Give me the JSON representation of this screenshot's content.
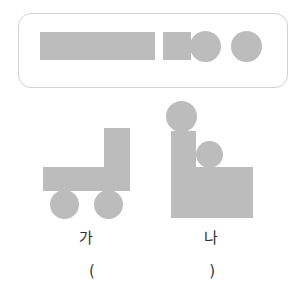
{
  "page": {
    "width": 304,
    "height": 298,
    "background_color": "#ffffff",
    "shape_fill_color": "#bcbcbc",
    "box_border_color": "#d2d2d2",
    "text_color": "#2f2f2f"
  },
  "parts_box": {
    "name": "parts-box",
    "x": 18,
    "y": 13,
    "width": 270,
    "height": 75,
    "corner_radius": 13,
    "shapes": [
      {
        "id": "long-rectangle",
        "type": "rectangle",
        "x": 40,
        "y": 32,
        "width": 115,
        "height": 28
      },
      {
        "id": "small-rectangle",
        "type": "rectangle",
        "x": 163,
        "y": 32,
        "width": 28,
        "height": 28
      },
      {
        "id": "circle-1",
        "type": "circle",
        "x": 190,
        "y": 31,
        "width": 31,
        "height": 31
      },
      {
        "id": "circle-2",
        "type": "circle",
        "x": 231,
        "y": 31,
        "width": 31,
        "height": 31
      }
    ]
  },
  "figures": [
    {
      "id": "figure-ga",
      "label": "가",
      "label_x": 86,
      "label_y": 231,
      "shapes": [
        {
          "id": "ga-vertical-rectangle",
          "type": "rectangle",
          "x": 104,
          "y": 128,
          "width": 26,
          "height": 40
        },
        {
          "id": "ga-horizontal-rectangle",
          "type": "rectangle",
          "x": 43,
          "y": 167,
          "width": 87,
          "height": 24
        },
        {
          "id": "ga-wheel-left",
          "type": "circle",
          "x": 50,
          "y": 190,
          "width": 29,
          "height": 29
        },
        {
          "id": "ga-wheel-right",
          "type": "circle",
          "x": 94,
          "y": 190,
          "width": 29,
          "height": 29
        }
      ]
    },
    {
      "id": "figure-na",
      "label": "나",
      "label_x": 211,
      "label_y": 231,
      "shapes": [
        {
          "id": "na-top-circle",
          "type": "circle",
          "x": 166,
          "y": 101,
          "width": 31,
          "height": 31
        },
        {
          "id": "na-tall-rectangle",
          "type": "rectangle",
          "x": 171,
          "y": 131,
          "width": 25,
          "height": 87
        },
        {
          "id": "na-middle-circle",
          "type": "circle",
          "x": 196,
          "y": 141,
          "width": 27,
          "height": 27
        },
        {
          "id": "na-body-rectangle",
          "type": "rectangle",
          "x": 196,
          "y": 167,
          "width": 57,
          "height": 51
        }
      ]
    }
  ],
  "answer": {
    "name": "answer-parentheses",
    "open_paren": "(",
    "close_paren": ")",
    "text": "(                        )"
  }
}
